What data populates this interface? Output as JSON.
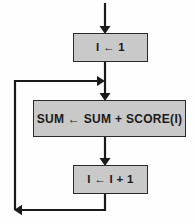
{
  "diagram": {
    "type": "flowchart",
    "background_color": "#fefefe",
    "box_fill_color": "#c9c9c9",
    "box_border_color": "#2b2b2b",
    "line_color": "#1a1a1a",
    "nodes": [
      {
        "id": "init",
        "shape": "process",
        "label": "I ← 1"
      },
      {
        "id": "accumulate",
        "shape": "process",
        "label": "SUM ← SUM + SCORE(I)"
      },
      {
        "id": "increment",
        "shape": "process",
        "label": "I ← I + 1"
      }
    ],
    "connectors": [
      {
        "id": "entry",
        "from": "top-edge",
        "to": "init",
        "arrow": "down"
      },
      {
        "id": "init-to-accumulate",
        "from": "init",
        "to": "accumulate",
        "arrow": "down"
      },
      {
        "id": "accumulate-to-increment",
        "from": "accumulate",
        "to": "increment",
        "arrow": "down"
      },
      {
        "id": "loop-back",
        "from": "increment",
        "to": "accumulate",
        "arrow": "left-then-up-then-right"
      }
    ]
  }
}
